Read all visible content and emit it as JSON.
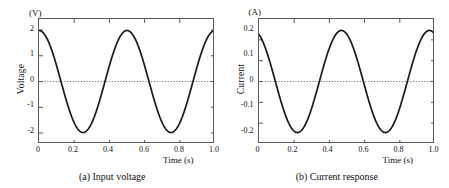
{
  "figure": {
    "width": 449,
    "height": 188,
    "background": "#ffffff",
    "axis_color": "#5a5a5a",
    "curve_color": "#1a1a1a",
    "zeroline_color": "#7a7a7a"
  },
  "panels": [
    {
      "id": "panel-a",
      "caption": "(a) Input voltage",
      "unit_label": "(V)",
      "y_title": "Voltage",
      "x_title": "Time (s)",
      "y_ticks": [
        "2",
        "1",
        "0",
        "-1",
        "-2"
      ],
      "x_ticks": [
        "0",
        "0.2",
        "0.4",
        "0.6",
        "0.8",
        "1.0"
      ]
    },
    {
      "id": "panel-b",
      "caption": "(b) Current response",
      "unit_label": "(A)",
      "y_title": "Current",
      "x_title": "Time (s)",
      "y_ticks": [
        "0.2",
        "0.1",
        "0",
        "-0.1",
        "-0.2"
      ],
      "x_ticks": [
        "0",
        "0.2",
        "0.4",
        "0.6",
        "0.8",
        "1.0"
      ]
    }
  ],
  "chart_data": [
    {
      "type": "line",
      "title": "(a) Input voltage",
      "xlabel": "Time (s)",
      "ylabel": "Voltage",
      "yunit": "(V)",
      "xlim": [
        0,
        1.0
      ],
      "ylim": [
        -2.45,
        2.45
      ],
      "xticks": [
        0,
        0.2,
        0.4,
        0.6,
        0.8,
        1.0
      ],
      "xticklabels": [
        "0",
        "0.2",
        "0.4",
        "0.6",
        "0.8",
        "1.0"
      ],
      "yticks": [
        2,
        1,
        0,
        -1,
        -2
      ],
      "yticklabels": [
        "2",
        "1",
        "0",
        "-1",
        "-2"
      ],
      "grid": false,
      "zero_line": true,
      "legend": "none",
      "waveform": {
        "form": "cosine",
        "amplitude": 2.0,
        "frequency_hz": 2.0,
        "period_s": 0.5,
        "phase_deg": 0,
        "offset": 0
      },
      "x": [
        0.0,
        0.025,
        0.05,
        0.075,
        0.1,
        0.125,
        0.15,
        0.175,
        0.2,
        0.225,
        0.25,
        0.275,
        0.3,
        0.325,
        0.35,
        0.375,
        0.4,
        0.425,
        0.45,
        0.475,
        0.5,
        0.525,
        0.55,
        0.575,
        0.6,
        0.625,
        0.65,
        0.675,
        0.7,
        0.725,
        0.75,
        0.775,
        0.8,
        0.825,
        0.85,
        0.875,
        0.9,
        0.925,
        0.95,
        0.975,
        1.0
      ],
      "y": [
        2.0,
        1.848,
        1.414,
        0.765,
        0.0,
        -0.765,
        -1.414,
        -1.848,
        -2.0,
        -1.848,
        -1.414,
        -0.765,
        0.0,
        0.765,
        1.414,
        1.848,
        2.0,
        1.848,
        1.414,
        0.765,
        0.0,
        -0.765,
        -1.414,
        -1.848,
        -2.0,
        -1.848,
        -1.414,
        -0.765,
        0.0,
        0.765,
        1.414,
        1.848,
        2.0,
        1.848,
        1.414,
        0.765,
        0.0,
        -0.765,
        -1.414,
        -1.848,
        -2.0
      ]
    },
    {
      "type": "line",
      "title": "(b) Current response",
      "xlabel": "Time (s)",
      "ylabel": "Current",
      "yunit": "(A)",
      "xlim": [
        0,
        1.0
      ],
      "ylim": [
        -0.3,
        0.3
      ],
      "xticks": [
        0,
        0.2,
        0.4,
        0.6,
        0.8,
        1.0
      ],
      "xticklabels": [
        "0",
        "0.2",
        "0.4",
        "0.6",
        "0.8",
        "1.0"
      ],
      "yticks": [
        0.2,
        0.1,
        0,
        -0.1,
        -0.2
      ],
      "yticklabels": [
        "0.2",
        "0.1",
        "0",
        "-0.1",
        "-0.2"
      ],
      "grid": false,
      "zero_line": true,
      "legend": "none",
      "waveform": {
        "form": "cosine",
        "amplitude": 0.245,
        "frequency_hz": 2.0,
        "period_s": 0.5,
        "phase_deg": 23,
        "offset": 0,
        "value_at_t0": 0.225
      },
      "x": [
        0.0,
        0.025,
        0.05,
        0.075,
        0.1,
        0.125,
        0.15,
        0.175,
        0.2,
        0.225,
        0.25,
        0.275,
        0.3,
        0.325,
        0.35,
        0.375,
        0.4,
        0.425,
        0.45,
        0.475,
        0.5,
        0.525,
        0.55,
        0.575,
        0.6,
        0.625,
        0.65,
        0.675,
        0.7,
        0.725,
        0.75,
        0.775,
        0.8,
        0.825,
        0.85,
        0.875,
        0.9,
        0.925,
        0.95,
        0.975,
        1.0
      ],
      "y": [
        0.225,
        0.146,
        0.048,
        -0.057,
        -0.152,
        -0.219,
        -0.245,
        -0.228,
        -0.169,
        -0.082,
        0.019,
        0.117,
        0.195,
        0.24,
        0.244,
        0.207,
        0.134,
        0.038,
        -0.067,
        -0.159,
        -0.223,
        -0.245,
        -0.224,
        -0.162,
        -0.072,
        0.029,
        0.126,
        0.202,
        0.243,
        0.243,
        0.202,
        0.126,
        0.029,
        -0.072,
        -0.162,
        -0.224,
        -0.245,
        -0.223,
        -0.159,
        -0.067,
        0.038
      ]
    }
  ]
}
